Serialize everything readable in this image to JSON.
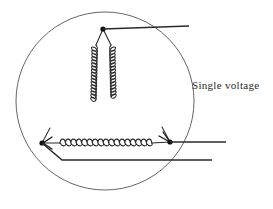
{
  "figure": {
    "title_text": "",
    "background_color": "#ffffff",
    "stroke_color": "#222222",
    "circle_color": "#555555",
    "coil_color": "#333333"
  },
  "labels": {
    "single_voltage": "Single voltage"
  },
  "diagram": {
    "enclosure": {
      "shape": "circle",
      "center_x": 105,
      "center_y": 101,
      "radius": 89
    },
    "nodes": [
      {
        "name": "top-vertex",
        "x": 103,
        "y": 29
      },
      {
        "name": "bottom-left-vertex",
        "x": 42,
        "y": 143
      },
      {
        "name": "bottom-right-vertex",
        "x": 170,
        "y": 142
      }
    ],
    "windings": [
      {
        "name": "left-winding",
        "from": "top-vertex",
        "to": "bottom-left-vertex",
        "turns": 17
      },
      {
        "name": "right-winding",
        "from": "top-vertex",
        "to": "bottom-right-vertex",
        "turns": 17
      },
      {
        "name": "bottom-winding",
        "from": "bottom-left-vertex",
        "to": "bottom-right-vertex",
        "turns": 18
      }
    ],
    "leads": [
      {
        "name": "lead-top",
        "from_x": 103,
        "from_y": 29,
        "to_x": 189,
        "to_y": 26
      },
      {
        "name": "lead-middle",
        "from_x": 170,
        "from_y": 142,
        "to_x": 226,
        "to_y": 142
      },
      {
        "name": "lead-bottom",
        "from_x": 42,
        "from_y": 143,
        "to_x": 212,
        "to_y": 160,
        "bend_x": 62,
        "bend_y": 160
      }
    ],
    "arrowheads": [
      {
        "name": "arrow-into-bottom-left",
        "x": 42,
        "y": 143,
        "direction": "left"
      },
      {
        "name": "arrow-into-bottom-right",
        "x": 170,
        "y": 142,
        "direction": "down-right"
      }
    ]
  }
}
